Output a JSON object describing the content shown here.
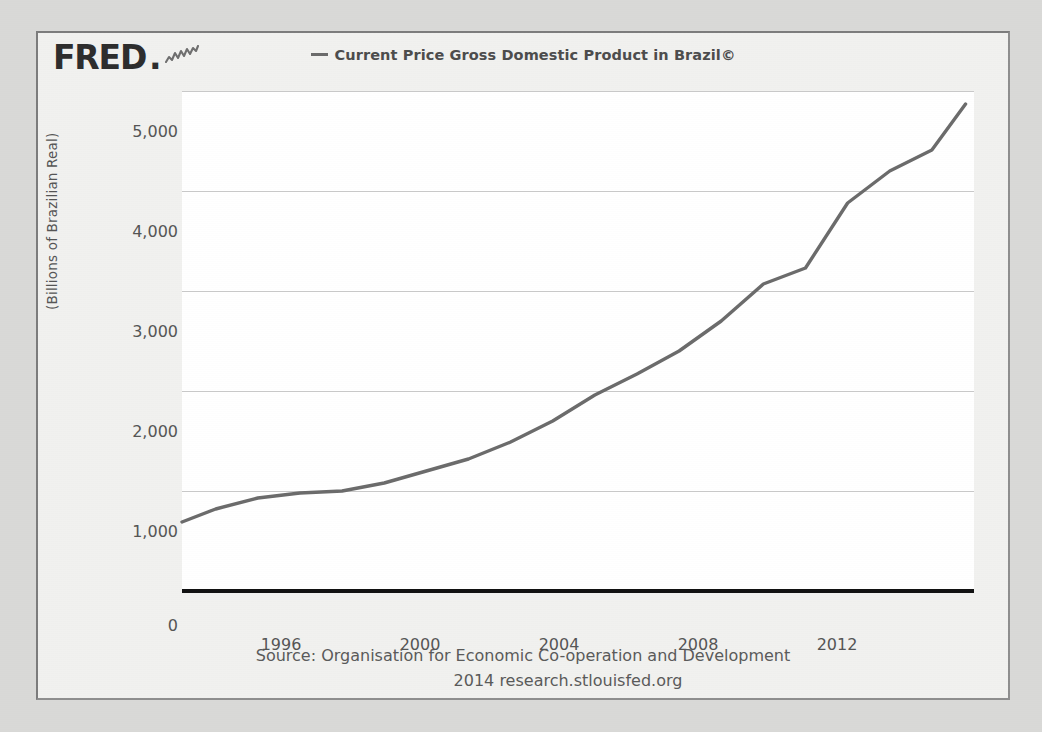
{
  "header": {
    "logo_text": "FRED",
    "logo_dot": ".",
    "logo_icon": "squiggle-chart-icon",
    "legend_label": "Current Price Gross Domestic Product in Brazil©"
  },
  "footer": {
    "source": "Source: Organisation for Economic Co-operation and Development",
    "url": "2014 research.stlouisfed.org"
  },
  "colors": {
    "series_line": "#6b6b6b",
    "grid": "#c9c9c9",
    "baseline": "#111111",
    "plot_background": "#ffffff",
    "card_background": "#f1f1ef",
    "page_background": "#d9d9d7",
    "text": "#555555"
  },
  "chart_data": {
    "type": "line",
    "title": "Current Price Gross Domestic Product in Brazil©",
    "xlabel": "",
    "ylabel": "(Billions of Brazilian Real)",
    "xlim": [
      1994.2,
      2013.0
    ],
    "ylim": [
      0,
      5000
    ],
    "xticks": [
      1996,
      2000,
      2004,
      2008,
      2012
    ],
    "xtick_labels": [
      "1996",
      "2000",
      "2004",
      "2008",
      "2012"
    ],
    "yticks": [
      0,
      1000,
      2000,
      3000,
      4000,
      5000
    ],
    "ytick_labels": [
      "0",
      "1,000",
      "2,000",
      "3,000",
      "4,000",
      "5,000"
    ],
    "grid": true,
    "legend_position": "top-center",
    "series": [
      {
        "name": "Current Price Gross Domestic Product in Brazil©",
        "color": "#6b6b6b",
        "units": "Billions of Brazilian Real",
        "x": [
          1994.2,
          1995,
          1996,
          1997,
          1998,
          1999,
          2000,
          2001,
          2002,
          2003,
          2004,
          2005,
          2006,
          2007,
          2008,
          2009,
          2010,
          2011,
          2012,
          2012.8
        ],
        "values": [
          690,
          820,
          930,
          980,
          1000,
          1080,
          1200,
          1320,
          1490,
          1700,
          1960,
          2170,
          2400,
          2700,
          3070,
          3230,
          3880,
          4200,
          4410,
          4870
        ]
      }
    ]
  }
}
